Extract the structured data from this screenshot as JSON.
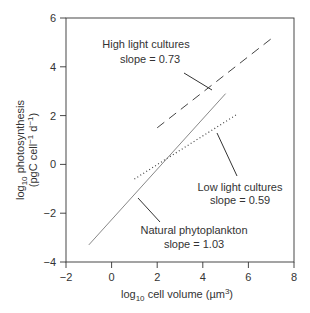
{
  "chart_data": {
    "type": "line",
    "title": "",
    "xlabel": "log10 cell volume (µm3)",
    "ylabel": "log10 photosynthesis (pgC cell-1 d-1)",
    "xlim": [
      -2,
      8
    ],
    "ylim": [
      -4,
      6
    ],
    "xticks": [
      -2,
      0,
      2,
      4,
      6,
      8
    ],
    "yticks": [
      -4,
      -2,
      0,
      2,
      4,
      6
    ],
    "grid": false,
    "legend": "none (inline annotations)",
    "series": [
      {
        "name": "High light cultures",
        "style": "dashed",
        "slope": 0.73,
        "x": [
          2.0,
          7.0
        ],
        "y": [
          1.5,
          5.15
        ]
      },
      {
        "name": "Low light cultures",
        "style": "dotted",
        "slope": 0.59,
        "x": [
          1.0,
          5.5
        ],
        "y": [
          -0.6,
          2.05
        ]
      },
      {
        "name": "Natural phytoplankton",
        "style": "solid",
        "slope": 1.03,
        "x": [
          -1.0,
          5.0
        ],
        "y": [
          -3.3,
          2.9
        ]
      }
    ],
    "annotations": [
      {
        "line1": "High light cultures",
        "line2": "slope = 0.73"
      },
      {
        "line1": "Low light cultures",
        "line2": "slope = 0.59"
      },
      {
        "line1": "Natural phytoplankton",
        "line2": "slope = 1.03"
      }
    ]
  },
  "labels": {
    "x_main": "log",
    "x_sub": "10",
    "x_rest": " cell volume (",
    "x_mu": "µm",
    "x_sup": "3",
    "x_close": ")",
    "y1_main": "log",
    "y1_sub": "10",
    "y1_rest": " photosynthesis",
    "y2_a": "(pgC cell",
    "y2_sup1": "−1",
    "y2_b": " d",
    "y2_sup2": "−1",
    "y2_c": ")"
  },
  "ticks": {
    "x": [
      "−2",
      "0",
      "2",
      "4",
      "6",
      "8"
    ],
    "y": [
      "−4",
      "−2",
      "0",
      "2",
      "4",
      "6"
    ]
  },
  "annotations": {
    "high": {
      "line1": "High light cultures",
      "line2": "slope = 0.73"
    },
    "low": {
      "line1": "Low light cultures",
      "line2": "slope = 0.59"
    },
    "natural": {
      "line1": "Natural phytoplankton",
      "line2": "slope = 1.03"
    }
  },
  "colors": {
    "axis": "#333333",
    "high_line": "#444444",
    "low_line": "#444444",
    "natural_line": "#888888",
    "leader": "#333333"
  }
}
